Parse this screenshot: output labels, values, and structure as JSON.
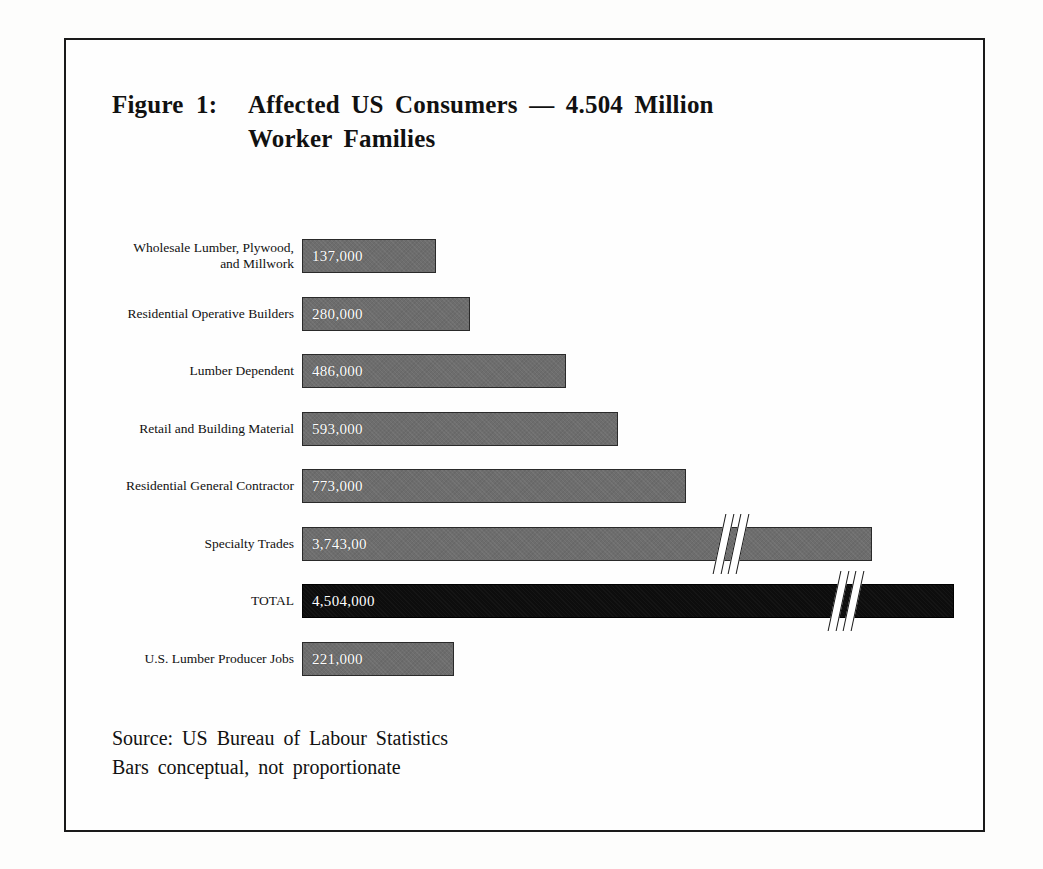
{
  "figure": {
    "tag": "Figure 1:",
    "title_line_1": "Affected US Consumers — 4.504 Million",
    "title_line_2": "Worker Families",
    "source_line_1": "Source: US Bureau of Labour Statistics",
    "source_line_2": "Bars conceptual, not proportionate"
  },
  "chart_data": {
    "type": "bar",
    "orientation": "horizontal",
    "title": "Figure 1: Affected US Consumers — 4.504 Million Worker Families",
    "xlabel": "",
    "ylabel": "",
    "grid": false,
    "legend": "none",
    "note": "Bars conceptual, not proportionate",
    "source": "US Bureau of Labour Statistics",
    "categories": [
      "Wholesale Lumber, Plywood, and Millwork",
      "Residential Operative Builders",
      "Lumber Dependent",
      "Retail and Building Material",
      "Residential General Contractor",
      "Specialty Trades",
      "TOTAL",
      "U.S. Lumber Producer Jobs"
    ],
    "values": [
      137000,
      280000,
      486000,
      593000,
      773000,
      3743000,
      4504000,
      221000
    ],
    "value_labels": [
      "137,000",
      "280,000",
      "486,000",
      "593,000",
      "773,000",
      "3,743,00",
      "4,504,000",
      "221,000"
    ],
    "bars": [
      {
        "label_line_1": "Wholesale Lumber, Plywood,",
        "label_line_2": "and Millwork",
        "value_label": "137,000",
        "value": 137000,
        "pixel_length": 134,
        "color": "#6d6d6d",
        "has_break": false
      },
      {
        "label_line_1": "Residential Operative Builders",
        "label_line_2": "",
        "value_label": "280,000",
        "value": 280000,
        "pixel_length": 168,
        "color": "#6d6d6d",
        "has_break": false
      },
      {
        "label_line_1": "Lumber Dependent",
        "label_line_2": "",
        "value_label": "486,000",
        "value": 486000,
        "pixel_length": 264,
        "color": "#6d6d6d",
        "has_break": false
      },
      {
        "label_line_1": "Retail and Building Material",
        "label_line_2": "",
        "value_label": "593,000",
        "value": 593000,
        "pixel_length": 316,
        "color": "#6d6d6d",
        "has_break": false
      },
      {
        "label_line_1": "Residential General Contractor",
        "label_line_2": "",
        "value_label": "773,000",
        "value": 773000,
        "pixel_length": 384,
        "color": "#6d6d6d",
        "has_break": false
      },
      {
        "label_line_1": "Specialty Trades",
        "label_line_2": "",
        "value_label": "3,743,00",
        "value": 3743000,
        "pixel_length": 570,
        "color": "#6d6d6d",
        "has_break": true,
        "break_at": 415
      },
      {
        "label_line_1": "TOTAL",
        "label_line_2": "",
        "value_label": "4,504,000",
        "value": 4504000,
        "pixel_length": 652,
        "color": "#0d0d0d",
        "has_break": true,
        "break_at": 530
      },
      {
        "label_line_1": "U.S. Lumber Producer Jobs",
        "label_line_2": "",
        "value_label": "221,000",
        "value": 221000,
        "pixel_length": 152,
        "color": "#6d6d6d",
        "has_break": false
      }
    ],
    "colors": {
      "bar": "#6d6d6d",
      "total_bar": "#0d0d0d",
      "bar_border": "#2a2a2a",
      "value_text": "#ffffff",
      "frame": "#1a1a1a",
      "background": "#fefefe"
    }
  }
}
